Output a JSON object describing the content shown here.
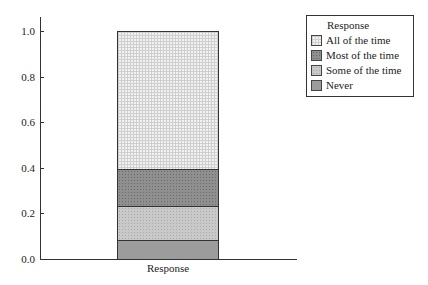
{
  "chart_data": {
    "type": "bar",
    "stacked": true,
    "categories": [
      "Response"
    ],
    "series": [
      {
        "name": "Never",
        "values": [
          0.083
        ],
        "pattern": "pat-never"
      },
      {
        "name": "Some of the time",
        "values": [
          0.149
        ],
        "pattern": "pat-some"
      },
      {
        "name": "Most of the time",
        "values": [
          0.163
        ],
        "pattern": "pat-most"
      },
      {
        "name": "All of the time",
        "values": [
          0.605
        ],
        "pattern": "pat-all"
      }
    ],
    "title": "",
    "xlabel": "Response",
    "ylabel": "",
    "ylim": [
      0,
      1.0
    ],
    "yticks": [
      "0.0",
      "0.2",
      "0.4",
      "0.6",
      "0.8",
      "1.0"
    ],
    "grid": false,
    "legend": {
      "title": "Response",
      "position": "top-right",
      "entries": [
        "All of the time",
        "Most of the time",
        "Some of the time",
        "Never"
      ]
    }
  }
}
